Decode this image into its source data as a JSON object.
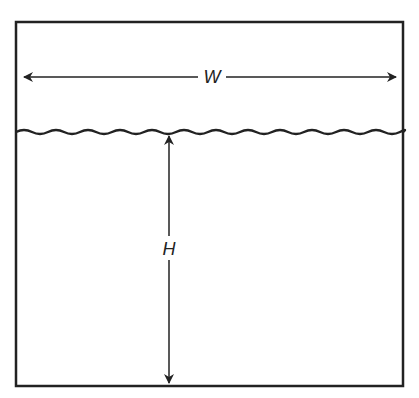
{
  "diagram": {
    "type": "tank-with-liquid",
    "labels": {
      "width": "W",
      "height": "H"
    },
    "colors": {
      "stroke": "#222222",
      "background": "#ffffff"
    }
  }
}
